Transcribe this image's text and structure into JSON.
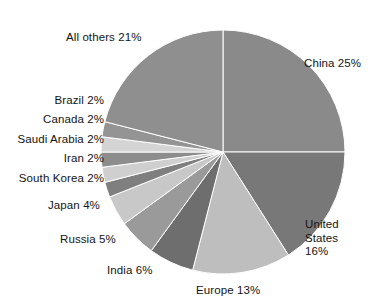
{
  "chart_data": {
    "type": "pie",
    "title": "",
    "subtitle": "",
    "xlabel": "",
    "ylabel": "",
    "legend_position": "none",
    "grid": false,
    "unit": "%",
    "start_angle_deg": 0,
    "direction": "clockwise",
    "center": {
      "x": 223,
      "y": 152
    },
    "radius": 122,
    "categories": [
      "China",
      "United States",
      "Europe",
      "India",
      "Russia",
      "Japan",
      "South Korea",
      "Iran",
      "Saudi Arabia",
      "Canada",
      "Brazil",
      "All others"
    ],
    "values": [
      25,
      16,
      13,
      6,
      5,
      4,
      2,
      2,
      2,
      2,
      2,
      21
    ],
    "colors": [
      "#8a8a8a",
      "#787878",
      "#bebebe",
      "#6e6e6e",
      "#9a9a9a",
      "#c8c8c8",
      "#7f7f7f",
      "#cfcfcf",
      "#8d8d8d",
      "#d4d4d4",
      "#949494",
      "#8f8f8f"
    ],
    "slice_border_color": "#ffffff",
    "slice_border_width": 1,
    "labels": [
      {
        "key": "china",
        "text": "China 25%",
        "align": "left"
      },
      {
        "key": "united-states",
        "text": "United\nStates\n16%",
        "align": "left"
      },
      {
        "key": "europe",
        "text": "Europe 13%",
        "align": "center"
      },
      {
        "key": "india",
        "text": "India 6%",
        "align": "center"
      },
      {
        "key": "russia",
        "text": "Russia 5%",
        "align": "center"
      },
      {
        "key": "japan",
        "text": "Japan 4%",
        "align": "center"
      },
      {
        "key": "south-korea",
        "text": "South Korea 2%",
        "align": "right"
      },
      {
        "key": "iran",
        "text": "Iran 2%",
        "align": "right"
      },
      {
        "key": "saudi-arabia",
        "text": "Saudi Arabia 2%",
        "align": "right"
      },
      {
        "key": "canada",
        "text": "Canada 2%",
        "align": "right"
      },
      {
        "key": "brazil",
        "text": "Brazil 2%",
        "align": "right"
      },
      {
        "key": "all-others",
        "text": "All others 21%",
        "align": "left"
      }
    ]
  }
}
